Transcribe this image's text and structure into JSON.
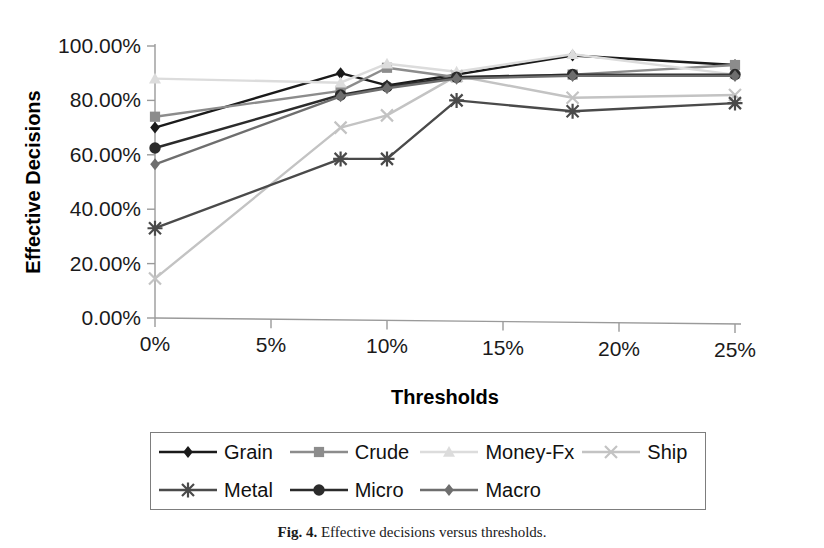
{
  "figure": {
    "caption_label": "Fig. 4.",
    "caption_text": "Effective decisions versus thresholds."
  },
  "axes": {
    "y_title": "Effective Decisions",
    "x_title": "Thresholds",
    "y_ticks": [
      "0.00%",
      "20.00%",
      "40.00%",
      "60.00%",
      "80.00%",
      "100.00%"
    ],
    "x_ticks": [
      "0%",
      "5%",
      "10%",
      "15%",
      "20%",
      "25%"
    ]
  },
  "legend": {
    "entries": [
      {
        "label": "Grain",
        "marker": "diamond-marker",
        "color": "#1a1a1a"
      },
      {
        "label": "Crude",
        "marker": "square-marker",
        "color": "#8c8c8c"
      },
      {
        "label": "Money-Fx",
        "marker": "triangle-marker",
        "color": "#dcdcdc"
      },
      {
        "label": "Ship",
        "marker": "cross-x-marker",
        "color": "#c3c3c3"
      },
      {
        "label": "Metal",
        "marker": "asterisk-marker",
        "color": "#4a4a4a"
      },
      {
        "label": "Micro",
        "marker": "circle-marker",
        "color": "#2b2b2b"
      },
      {
        "label": "Macro",
        "marker": "diamond-marker",
        "color": "#6e6e6e"
      }
    ]
  },
  "chart_data": {
    "type": "line",
    "title": "",
    "xlabel": "Thresholds",
    "ylabel": "Effective Decisions",
    "xlim": [
      0,
      25
    ],
    "ylim": [
      0,
      100
    ],
    "x_unit": "percent",
    "y_unit": "percent",
    "grid": false,
    "legend_position": "bottom",
    "x": [
      0,
      8,
      10,
      13,
      18,
      25
    ],
    "series": [
      {
        "name": "Grain",
        "marker": "diamond-marker",
        "color": "#1a1a1a",
        "values": [
          70.0,
          90.0,
          85.5,
          89.5,
          96.5,
          93.0
        ]
      },
      {
        "name": "Crude",
        "marker": "square-marker",
        "color": "#8c8c8c",
        "values": [
          74.0,
          83.5,
          92.0,
          88.5,
          89.5,
          93.0
        ]
      },
      {
        "name": "Money-Fx",
        "marker": "triangle-marker",
        "color": "#dcdcdc",
        "values": [
          88.0,
          86.5,
          93.5,
          90.5,
          97.0,
          89.5
        ]
      },
      {
        "name": "Ship",
        "marker": "cross-x-marker",
        "color": "#c3c3c3",
        "values": [
          14.5,
          70.0,
          74.5,
          89.0,
          81.0,
          82.0
        ]
      },
      {
        "name": "Metal",
        "marker": "asterisk-marker",
        "color": "#4a4a4a",
        "values": [
          33.0,
          58.5,
          58.5,
          80.0,
          76.0,
          79.0
        ]
      },
      {
        "name": "Micro",
        "marker": "circle-marker",
        "color": "#2b2b2b",
        "values": [
          62.5,
          82.0,
          85.0,
          88.5,
          89.5,
          89.5
        ]
      },
      {
        "name": "Macro",
        "marker": "diamond-marker",
        "color": "#6e6e6e",
        "values": [
          56.5,
          81.5,
          84.5,
          88.0,
          89.0,
          89.0
        ]
      }
    ]
  }
}
